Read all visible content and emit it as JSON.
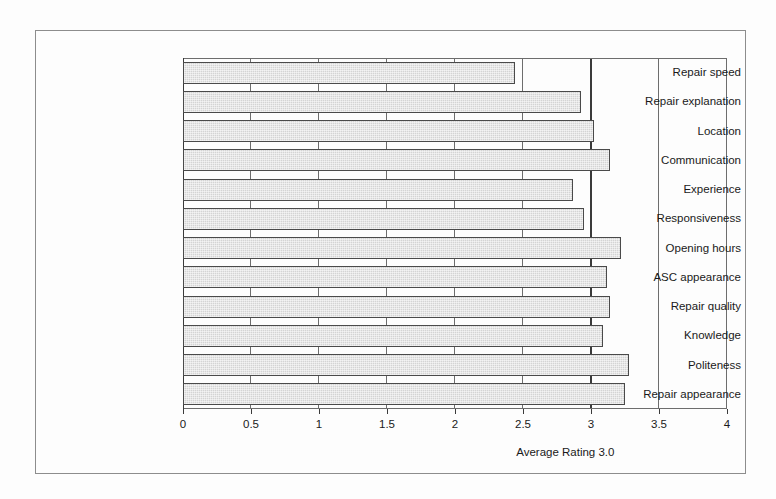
{
  "chart_data": {
    "type": "bar",
    "orientation": "horizontal",
    "title": "",
    "xlabel": "Average Rating",
    "ylabel": "",
    "xlim": [
      0,
      4
    ],
    "xticks": [
      "0",
      "0.5",
      "1",
      "1.5",
      "2",
      "2.5",
      "3",
      "3.5",
      "4"
    ],
    "xtick_values": [
      0,
      0.5,
      1,
      1.5,
      2,
      2.5,
      3,
      3.5,
      4
    ],
    "grid": true,
    "legend": false,
    "categories": [
      "Repair speed",
      "Repair explanation",
      "Location",
      "Communication",
      "Experience",
      "Responsiveness",
      "Opening hours",
      "ASC appearance",
      "Repair quality",
      "Knowledge",
      "Politeness",
      "Repair appearance"
    ],
    "values": [
      2.44,
      2.93,
      3.02,
      3.14,
      2.87,
      2.95,
      3.22,
      3.12,
      3.14,
      3.09,
      3.28,
      3.25
    ],
    "annotations": [
      {
        "name": "average-rating-line",
        "label": "Average Rating 3.0",
        "value": 3.0
      }
    ],
    "bar_color": "#d4d4d4",
    "bar_border_color": "#4a4a4a",
    "axis_color": "#3a3a3a",
    "grid_color": "#6d6d6d",
    "background": "#fdfdfd"
  },
  "axis_title": {
    "prefix": "Average Rating",
    "value": "3.0"
  }
}
